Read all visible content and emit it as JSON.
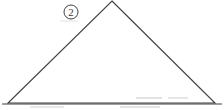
{
  "figure": {
    "title": "Triangle with circled label 2",
    "background_color": "#ffffff",
    "stroke_color": "#3f3f3f",
    "artifact_color": "#d9d9d9",
    "width": 224,
    "height": 110
  },
  "shape": {
    "name": "triangle",
    "type": "polygon",
    "vertices": [
      {
        "name": "apex",
        "x": 112,
        "y": 1
      },
      {
        "name": "bottom-right",
        "x": 215,
        "y": 103
      },
      {
        "name": "bottom-left",
        "x": 8,
        "y": 103
      }
    ],
    "stroke_width": 1.1,
    "fill": "none"
  },
  "baseline": {
    "name": "base-line",
    "x1": 2,
    "y1": 104,
    "x2": 222,
    "y2": 104
  },
  "annotations": [
    {
      "id": "label-2",
      "text": "2",
      "shape": "circle",
      "cx": 71,
      "cy": 12,
      "r": 7,
      "text_x": 71,
      "text_y": 16
    }
  ],
  "artifacts": [
    {
      "x": 136,
      "y": 97,
      "width": 26,
      "height": 2
    },
    {
      "x": 168,
      "y": 97,
      "width": 20,
      "height": 2
    },
    {
      "x": 120,
      "y": 106,
      "width": 40,
      "height": 2
    },
    {
      "x": 30,
      "y": 106,
      "width": 34,
      "height": 2
    }
  ]
}
